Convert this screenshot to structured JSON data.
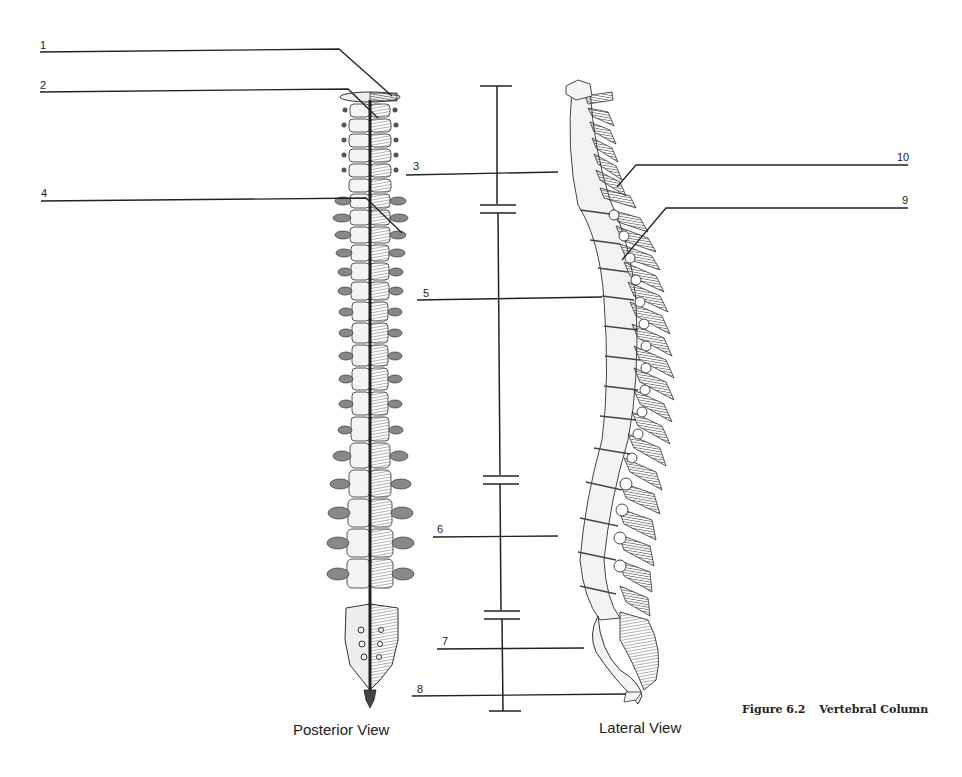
{
  "figure": {
    "number": "Figure 6.2",
    "title": "Vertebral Column"
  },
  "views": {
    "posterior": "Posterior View",
    "lateral": "Lateral View"
  },
  "labels": [
    {
      "id": "1",
      "text": "1",
      "side": "left"
    },
    {
      "id": "2",
      "text": "2",
      "side": "left"
    },
    {
      "id": "3",
      "text": "3",
      "side": "center"
    },
    {
      "id": "4",
      "text": "4",
      "side": "left"
    },
    {
      "id": "5",
      "text": "5",
      "side": "center"
    },
    {
      "id": "6",
      "text": "6",
      "side": "center"
    },
    {
      "id": "7",
      "text": "7",
      "side": "center"
    },
    {
      "id": "8",
      "text": "8",
      "side": "center"
    },
    {
      "id": "9",
      "text": "9",
      "side": "right"
    },
    {
      "id": "10",
      "text": "10",
      "side": "right"
    }
  ],
  "colors": {
    "line": "#222222",
    "bone_light": "#f2f2f2",
    "bone_mid": "#9a9a9a",
    "bone_dark": "#555555",
    "background": "#ffffff"
  }
}
